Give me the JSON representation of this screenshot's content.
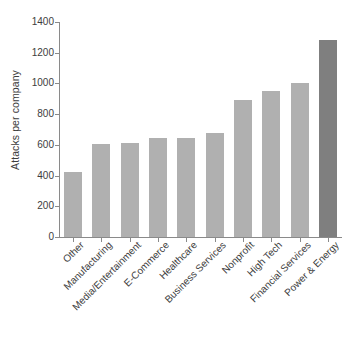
{
  "chart_data": {
    "type": "bar",
    "title": "",
    "xlabel": "",
    "ylabel": "Attacks per company",
    "ylim": [
      0,
      1400
    ],
    "yticks": [
      0,
      200,
      400,
      600,
      800,
      1000,
      1200,
      1400
    ],
    "ytick_labels": [
      "0",
      "200",
      "400",
      "600",
      "800",
      "1000",
      "1200",
      "1400"
    ],
    "grid": false,
    "legend": "none",
    "categories": [
      "Other",
      "Manufacturing",
      "Media/Entertainment",
      "E-Commerce",
      "Healthcare",
      "Business Services",
      "Nonprofit",
      "High Tech",
      "Financial Services",
      "Power & Energy"
    ],
    "values": [
      425,
      605,
      610,
      645,
      648,
      680,
      890,
      950,
      1000,
      1285
    ],
    "bar_colors": [
      "#b0b0b0",
      "#b0b0b0",
      "#b0b0b0",
      "#b0b0b0",
      "#b0b0b0",
      "#b0b0b0",
      "#b0b0b0",
      "#b0b0b0",
      "#b0b0b0",
      "#7f7f7f"
    ],
    "highlight_category": "Power & Energy",
    "highlight_color": "#7f7f7f",
    "series_color": "#b0b0b0",
    "axis_color": "#8a8a8a",
    "background": "#ffffff"
  }
}
